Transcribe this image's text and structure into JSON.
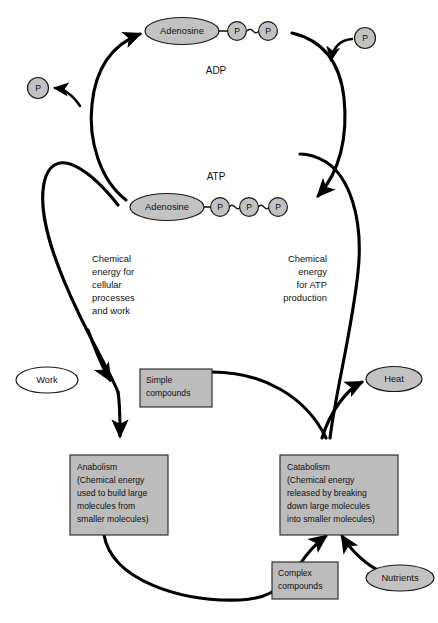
{
  "diagram": {
    "colors": {
      "node_fill": "#c2c2c2",
      "box_fill": "#bcbcbc",
      "stroke": "#000000",
      "background": "#ffffff",
      "text": "#111111"
    },
    "cycle_labels": {
      "adp": "ADP",
      "atp": "ATP"
    },
    "molecules": {
      "adp": {
        "adenosine_label": "Adenosine",
        "phosphate_label": "P",
        "phosphate_count": 2,
        "bond_symbol": "~"
      },
      "atp": {
        "adenosine_label": "Adenosine",
        "phosphate_label": "P",
        "phosphate_count": 3,
        "bond_symbol": "~"
      }
    },
    "free_phosphates": [
      {
        "name": "phosphate-released",
        "label": "P"
      },
      {
        "name": "phosphate-incoming",
        "label": "P"
      }
    ],
    "side_labels": {
      "left": "Chemical\nenergy for\ncellular\nprocesses\nand work",
      "left_lines": [
        "Chemical",
        "energy for",
        "cellular",
        "processes",
        "and work"
      ],
      "right_lines": [
        "Chemical",
        "energy",
        "for ATP",
        "production"
      ]
    },
    "ellipse_nodes": [
      {
        "name": "work",
        "label": "Work",
        "fill": "#ffffff"
      },
      {
        "name": "heat",
        "label": "Heat",
        "fill": "#c2c2c2"
      },
      {
        "name": "nutrients",
        "label": "Nutrients",
        "fill": "#c2c2c2"
      }
    ],
    "box_nodes": [
      {
        "name": "simple-compounds",
        "lines": [
          "Simple",
          "compounds"
        ]
      },
      {
        "name": "complex-compounds",
        "lines": [
          "Complex",
          "compounds"
        ]
      },
      {
        "name": "anabolism",
        "lines": [
          "Anabolism",
          "(Chemical energy",
          "used to build large",
          "molecules from",
          "smaller molecules)"
        ]
      },
      {
        "name": "catabolism",
        "lines": [
          "Catabolism",
          "(Chemical energy",
          "released by breaking",
          "down large molecules",
          "into smaller molecules)"
        ]
      }
    ]
  }
}
